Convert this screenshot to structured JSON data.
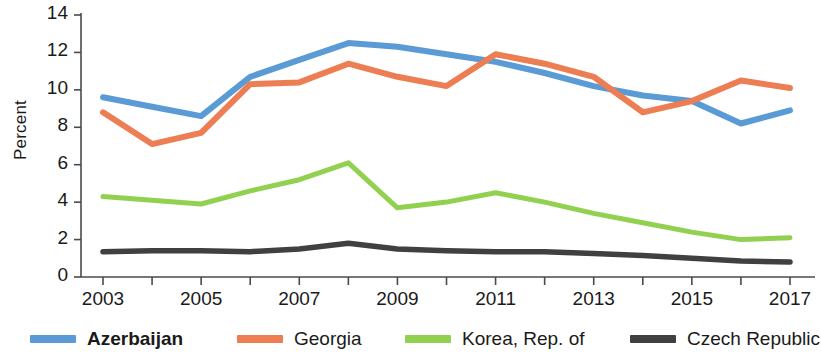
{
  "chart_data": {
    "type": "line",
    "title": "",
    "xlabel": "",
    "ylabel": "Percent",
    "x": [
      2003,
      2004,
      2005,
      2006,
      2007,
      2008,
      2009,
      2010,
      2011,
      2012,
      2013,
      2014,
      2015,
      2016,
      2017
    ],
    "xtick_labels": [
      "2003",
      "2005",
      "2007",
      "2009",
      "2011",
      "2013",
      "2015",
      "2017"
    ],
    "xtick_values": [
      2003,
      2005,
      2007,
      2009,
      2011,
      2013,
      2015,
      2017
    ],
    "ytick_labels": [
      "0",
      "2",
      "4",
      "6",
      "8",
      "10",
      "12",
      "14"
    ],
    "ytick_values": [
      0,
      2,
      4,
      6,
      8,
      10,
      12,
      14
    ],
    "xlim": [
      2003,
      2017
    ],
    "ylim": [
      0,
      14
    ],
    "grid": false,
    "legend_position": "bottom",
    "series": [
      {
        "name": "Azerbaijan",
        "color": "#5B9BD5",
        "emphasis": "bold",
        "values": [
          9.6,
          9.1,
          8.6,
          10.7,
          11.6,
          12.5,
          12.3,
          11.9,
          11.5,
          10.9,
          10.2,
          9.7,
          9.4,
          8.2,
          8.9
        ]
      },
      {
        "name": "Georgia",
        "color": "#ED7D52",
        "emphasis": "normal",
        "values": [
          8.8,
          7.1,
          7.7,
          10.3,
          10.4,
          11.4,
          10.7,
          10.2,
          11.9,
          11.4,
          10.7,
          8.8,
          9.4,
          10.5,
          10.1
        ]
      },
      {
        "name": "Korea, Rep. of",
        "color": "#92D050",
        "emphasis": "normal",
        "values": [
          4.3,
          4.1,
          3.9,
          4.6,
          5.2,
          6.1,
          3.7,
          4.0,
          4.5,
          4.0,
          3.4,
          2.9,
          2.4,
          2.0,
          2.1
        ]
      },
      {
        "name": "Czech Republic",
        "color": "#404040",
        "emphasis": "normal",
        "values": [
          1.35,
          1.4,
          1.4,
          1.35,
          1.5,
          1.8,
          1.5,
          1.4,
          1.35,
          1.35,
          1.25,
          1.15,
          1.0,
          0.85,
          0.8
        ]
      }
    ]
  },
  "axis": {
    "ylabel": "Percent"
  },
  "legend": {
    "items": [
      {
        "label": "Azerbaijan"
      },
      {
        "label": "Georgia"
      },
      {
        "label": "Korea, Rep. of"
      },
      {
        "label": "Czech Republic"
      }
    ]
  }
}
